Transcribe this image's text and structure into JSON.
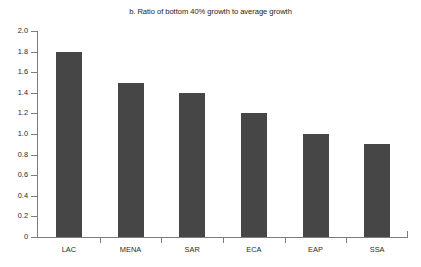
{
  "chart_data": {
    "type": "bar",
    "title": "b. Ratio of bottom 40% growth to average growth",
    "xlabel": "",
    "ylabel": "",
    "categories": [
      "LAC",
      "MENA",
      "SAR",
      "ECA",
      "EAP",
      "SSA"
    ],
    "values": [
      1.8,
      1.5,
      1.4,
      1.2,
      1.0,
      0.9
    ],
    "ylim": [
      0,
      2.0
    ],
    "ytick_labels": [
      "0",
      "0.2",
      "0.4",
      "0.6",
      "0.8",
      "1.0",
      "1.2",
      "1.4",
      "1.6",
      "1.8",
      "2.0"
    ],
    "ytick_values": [
      0,
      0.2,
      0.4,
      0.6,
      0.8,
      1.0,
      1.2,
      1.4,
      1.6,
      1.8,
      2.0
    ],
    "grid": false,
    "legend": null,
    "bar_color": "#464646",
    "axis_color": "#7d7d7d",
    "background_color": "#ffffff"
  }
}
